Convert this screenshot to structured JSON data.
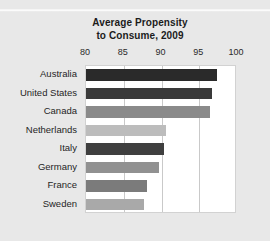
{
  "chart_data": {
    "type": "bar",
    "orientation": "horizontal",
    "title": "Average Propensity to Consume, 2009",
    "title_lines": [
      "Average Propensity",
      "to Consume, 2009"
    ],
    "xlabel": "",
    "ylabel": "",
    "xlim": [
      80,
      100
    ],
    "xticks": [
      80,
      85,
      90,
      95,
      100
    ],
    "xtick_labels": [
      "80",
      "85",
      "90",
      "95",
      "100"
    ],
    "grid": "vertical",
    "legend": "none",
    "categories": [
      "Australia",
      "United States",
      "Canada",
      "Netherlands",
      "Italy",
      "Germany",
      "France",
      "Sweden"
    ],
    "values": [
      97.3,
      96.7,
      96.4,
      90.6,
      90.3,
      89.7,
      88.1,
      87.7
    ],
    "bar_colors": [
      "#2a2a2a",
      "#3a3a3a",
      "#8a8a8a",
      "#bcbcbc",
      "#3f3f3f",
      "#919191",
      "#7b7b7b",
      "#a9a9a9"
    ]
  },
  "figure": {
    "background_color": "#e8e8e8",
    "plot_background_color": "#ffffff",
    "gridline_color": "#c9c9c9",
    "text_color": "#1f1f1f"
  }
}
